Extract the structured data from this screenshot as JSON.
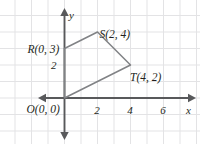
{
  "figure": {
    "kind": "coordinate-plane",
    "width": 200,
    "height": 144,
    "background": "#ffffff",
    "grid_color": "#e3e3e5",
    "axis_color": "#58595b",
    "shape_color": "#808285",
    "text_color": "#231f20"
  },
  "axes": {
    "x_label": "x",
    "y_label": "y",
    "x_ticks": [
      {
        "value": 2,
        "label": "2"
      },
      {
        "value": 4,
        "label": "4"
      },
      {
        "value": 6,
        "label": "6"
      }
    ],
    "y_ticks": [
      {
        "value": 2,
        "label": "2"
      }
    ],
    "x_range": [
      -3.8,
      8.2
    ],
    "y_range": [
      -2.7,
      5.6
    ],
    "grid": true,
    "grid_step": 1
  },
  "shape": {
    "name": "quadrilateral-ORST",
    "closed": true,
    "vertices": [
      {
        "id": "O",
        "x": 0,
        "y": 0,
        "label": "O(0, 0)"
      },
      {
        "id": "R",
        "x": 0,
        "y": 3,
        "label": "R(0, 3)"
      },
      {
        "id": "S",
        "x": 2,
        "y": 4,
        "label": "S(2, 4)"
      },
      {
        "id": "T",
        "x": 4,
        "y": 2,
        "label": "T(4, 2)"
      }
    ]
  },
  "chart_data": {
    "type": "scatter",
    "title": "",
    "xlabel": "x",
    "ylabel": "y",
    "xlim": [
      -3.8,
      8.2
    ],
    "ylim": [
      -2.7,
      5.6
    ],
    "grid": true,
    "legend": "none",
    "series": [
      {
        "name": "Quadrilateral ORST",
        "x": [
          0,
          0,
          2,
          4,
          0
        ],
        "y": [
          0,
          3,
          4,
          2,
          0
        ],
        "point_labels": [
          "O(0, 0)",
          "R(0, 3)",
          "S(2, 4)",
          "T(4, 2)",
          ""
        ]
      }
    ],
    "xticks": [
      2,
      4,
      6
    ],
    "yticks": [
      2
    ],
    "xticklabels": [
      "2",
      "4",
      "6"
    ],
    "yticklabels": [
      "2"
    ]
  }
}
